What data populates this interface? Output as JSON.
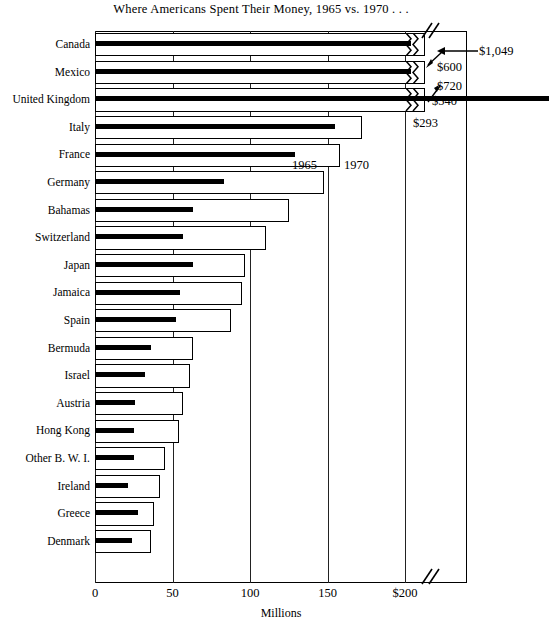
{
  "chart_data": {
    "type": "bar",
    "orientation": "horizontal",
    "title": "Where Americans Spent Their Money, 1965 vs. 1970 . . .",
    "xlabel": "Millions",
    "ylabel": "",
    "xlim": [
      0,
      240
    ],
    "grid": true,
    "legend_position": "inline-on-france-row",
    "xticks": [
      {
        "value": 0,
        "label": "0"
      },
      {
        "value": 50,
        "label": "50"
      },
      {
        "value": 100,
        "label": "100"
      },
      {
        "value": 150,
        "label": "150"
      },
      {
        "value": 200,
        "label": "$200"
      }
    ],
    "axis_break": true,
    "axis_break_note": "scale broken near right edge; top three bars truncated",
    "categories": [
      "Canada",
      "Mexico",
      "United Kingdom",
      "Italy",
      "France",
      "Germany",
      "Bahamas",
      "Switzerland",
      "Japan",
      "Jamaica",
      "Spain",
      "Bermuda",
      "Israel",
      "Austria",
      "Hong Kong",
      "Other B. W. I.",
      "Ireland",
      "Greece",
      "Denmark"
    ],
    "series": [
      {
        "name": "1965",
        "color": "#000000",
        "values": [
          600,
          540,
          293,
          155,
          129,
          83,
          63,
          57,
          63,
          55,
          52,
          36,
          32,
          26,
          25,
          25,
          21,
          28,
          24
        ],
        "broken": [
          true,
          true,
          false,
          false,
          false,
          false,
          false,
          false,
          false,
          false,
          false,
          false,
          false,
          false,
          false,
          false,
          false,
          false,
          false
        ]
      },
      {
        "name": "1970",
        "color": "#ffffff",
        "values": [
          1049,
          720,
          540,
          172,
          158,
          148,
          125,
          110,
          97,
          95,
          88,
          63,
          61,
          57,
          54,
          45,
          42,
          38,
          36
        ],
        "broken": [
          true,
          true,
          true,
          false,
          false,
          false,
          false,
          false,
          false,
          false,
          false,
          false,
          false,
          false,
          false,
          false,
          false,
          false,
          false
        ]
      }
    ],
    "annotations": [
      {
        "label": "$1,049",
        "target": "Canada 1970"
      },
      {
        "label": "$600",
        "target": "Canada 1965"
      },
      {
        "label": "$720",
        "target": "Mexico 1970"
      },
      {
        "label": "$540",
        "target": "Mexico 1965"
      },
      {
        "label": "$293",
        "target": "United Kingdom 1965"
      }
    ],
    "inline_legend": [
      {
        "label": "1965",
        "row": "France"
      },
      {
        "label": "1970",
        "row": "France"
      }
    ]
  }
}
